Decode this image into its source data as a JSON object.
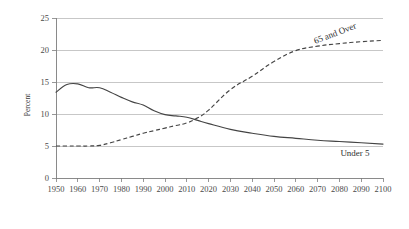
{
  "chart_data": {
    "type": "line",
    "title": "",
    "xlabel": "",
    "ylabel": "Percent",
    "xlim": [
      1950,
      2100
    ],
    "ylim": [
      0,
      25
    ],
    "ytick_labels": [
      "0",
      "5",
      "10",
      "15",
      "20",
      "25"
    ],
    "yticks": [
      0,
      5,
      10,
      15,
      20,
      25
    ],
    "xtick_labels": [
      "1950",
      "1960",
      "1970",
      "1980",
      "1990",
      "2000",
      "2010",
      "2020",
      "2030",
      "2040",
      "2050",
      "2060",
      "2070",
      "2080",
      "2090",
      "2100"
    ],
    "xticks": [
      1950,
      1960,
      1970,
      1980,
      1990,
      2000,
      2010,
      2020,
      2030,
      2040,
      2050,
      2060,
      2070,
      2080,
      2090,
      2100
    ],
    "grid": true,
    "legend_position": "inline-annotation",
    "series": [
      {
        "name": "Under 5",
        "style": "solid",
        "color": "#444444",
        "label_annotation": "Under 5",
        "x": [
          1950,
          1955,
          1960,
          1965,
          1970,
          1975,
          1980,
          1985,
          1990,
          1995,
          2000,
          2005,
          2010,
          2015,
          2020,
          2030,
          2040,
          2050,
          2060,
          2070,
          2080,
          2090,
          2100
        ],
        "values": [
          13.4,
          14.6,
          14.7,
          14.1,
          14.1,
          13.4,
          12.6,
          11.9,
          11.4,
          10.5,
          9.9,
          9.7,
          9.5,
          9.0,
          8.5,
          7.6,
          7.0,
          6.5,
          6.2,
          5.9,
          5.7,
          5.5,
          5.3
        ]
      },
      {
        "name": "65 and Over",
        "style": "dashed",
        "color": "#444444",
        "label_annotation": "65 and Over",
        "x": [
          1950,
          1955,
          1960,
          1965,
          1970,
          1975,
          1980,
          1985,
          1990,
          1995,
          2000,
          2005,
          2010,
          2015,
          2020,
          2030,
          2040,
          2050,
          2060,
          2070,
          2080,
          2090,
          2100
        ],
        "values": [
          5.0,
          5.0,
          5.0,
          5.0,
          5.1,
          5.5,
          6.0,
          6.5,
          7.0,
          7.4,
          7.8,
          8.2,
          8.6,
          9.4,
          10.6,
          13.8,
          15.9,
          18.2,
          19.9,
          20.6,
          21.0,
          21.3,
          21.5
        ]
      }
    ]
  }
}
